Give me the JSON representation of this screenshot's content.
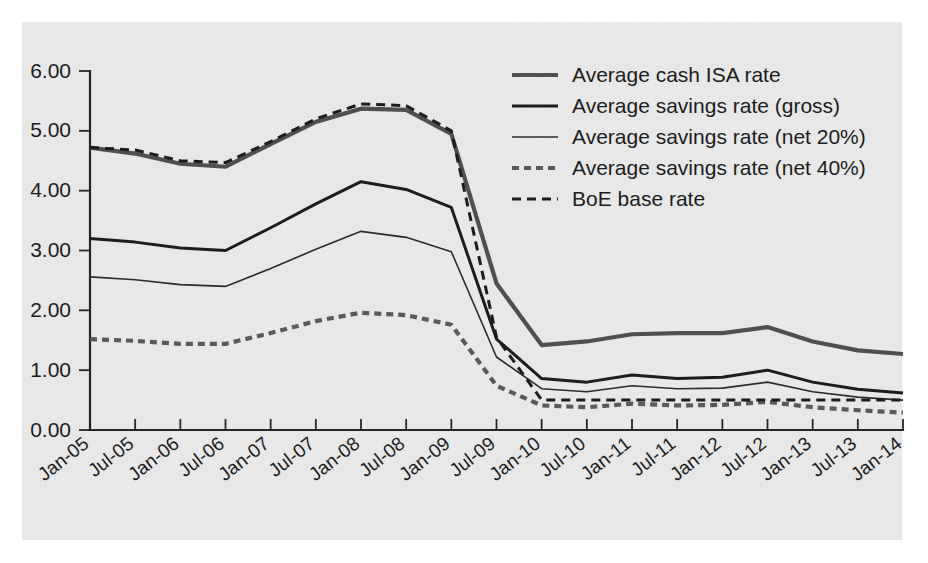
{
  "chart_data": {
    "type": "line",
    "title": "",
    "subtitle": "",
    "xlabel": "",
    "ylabel": "",
    "grid": false,
    "legend_position": "top-right",
    "ylim": [
      0,
      6
    ],
    "ytick_labels": [
      "0.00",
      "1.00",
      "2.00",
      "3.00",
      "4.00",
      "5.00",
      "6.00"
    ],
    "ytick_values": [
      0,
      1,
      2,
      3,
      4,
      5,
      6
    ],
    "categories": [
      "Jan-05",
      "Jul-05",
      "Jan-06",
      "Jul-06",
      "Jan-07",
      "Jul-07",
      "Jan-08",
      "Jul-08",
      "Jan-09",
      "Jul-09",
      "Jan-10",
      "Jul-10",
      "Jan-11",
      "Jul-11",
      "Jan-12",
      "Jul-12",
      "Jan-13",
      "Jul-13",
      "Jan-14"
    ],
    "series": [
      {
        "name": "Average cash ISA rate",
        "style": "solid",
        "width": 4.2,
        "color": "#4f4f4f",
        "values": [
          4.72,
          4.62,
          4.45,
          4.4,
          4.78,
          5.15,
          5.37,
          5.35,
          4.95,
          2.45,
          1.42,
          1.48,
          1.6,
          1.62,
          1.62,
          1.72,
          1.48,
          1.33,
          1.27
        ]
      },
      {
        "name": "Average savings rate (gross)",
        "style": "solid",
        "width": 3.0,
        "color": "#1c1c1c",
        "values": [
          3.2,
          3.14,
          3.04,
          3.0,
          3.38,
          3.78,
          4.15,
          4.02,
          3.72,
          1.52,
          0.86,
          0.8,
          0.92,
          0.86,
          0.88,
          1.0,
          0.8,
          0.68,
          0.62
        ]
      },
      {
        "name": "Average savings rate (net 20%)",
        "style": "solid",
        "width": 1.6,
        "color": "#2b2b2b",
        "values": [
          2.56,
          2.51,
          2.43,
          2.4,
          2.7,
          3.02,
          3.32,
          3.22,
          2.98,
          1.22,
          0.69,
          0.64,
          0.74,
          0.69,
          0.7,
          0.8,
          0.64,
          0.55,
          0.5
        ]
      },
      {
        "name": "Average savings rate (net 40%)",
        "style": "dashed-thick",
        "width": 4.2,
        "color": "#5a5a5a",
        "values": [
          1.52,
          1.49,
          1.44,
          1.44,
          1.62,
          1.82,
          1.96,
          1.92,
          1.76,
          0.74,
          0.41,
          0.38,
          0.44,
          0.41,
          0.42,
          0.47,
          0.38,
          0.33,
          0.29
        ]
      },
      {
        "name": "BoE base rate",
        "style": "dashed-thin",
        "width": 3.0,
        "color": "#1c1c1c",
        "values": [
          4.72,
          4.68,
          4.5,
          4.47,
          4.82,
          5.2,
          5.45,
          5.42,
          5.0,
          1.55,
          0.5,
          0.5,
          0.5,
          0.5,
          0.5,
          0.5,
          0.5,
          0.5,
          0.5
        ]
      }
    ]
  },
  "legend": {
    "entries": [
      {
        "label": "Average cash ISA rate"
      },
      {
        "label": "Average savings rate (gross)"
      },
      {
        "label": "Average savings rate (net 20%)"
      },
      {
        "label": "Average savings rate (net 40%)"
      },
      {
        "label": "BoE base rate"
      }
    ]
  },
  "colors": {
    "panel_background": "#ebebeb",
    "page_background": "#ffffff",
    "axis": "#262626",
    "text": "#1c1c1c"
  }
}
